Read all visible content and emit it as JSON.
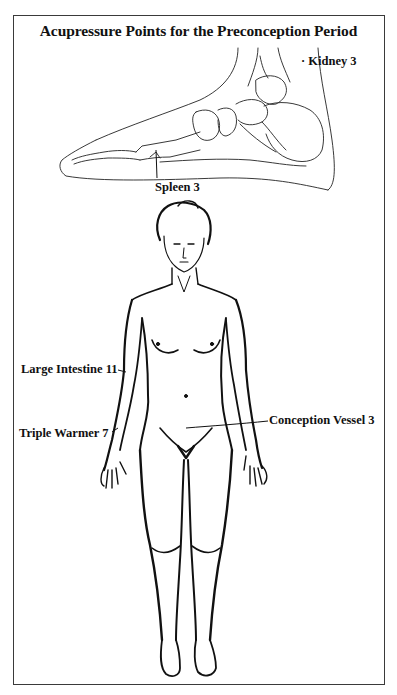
{
  "figure": {
    "title": "Acupressure Points for the Preconception Period",
    "illustrations": [
      "foot-medial-view",
      "female-body-front-view"
    ],
    "colors": {
      "ink": "#111111",
      "frame": "#3a3a3a",
      "background": "#ffffff"
    }
  },
  "labels": {
    "kidney": {
      "text": "Kidney 3",
      "marker": "·"
    },
    "spleen": {
      "text": "Spleen 3"
    },
    "large_intestine": {
      "text": "Large Intestine 11"
    },
    "triple_warmer": {
      "text": "Triple Warmer 7"
    },
    "conception_vessel": {
      "text": "Conception Vessel 3"
    }
  }
}
